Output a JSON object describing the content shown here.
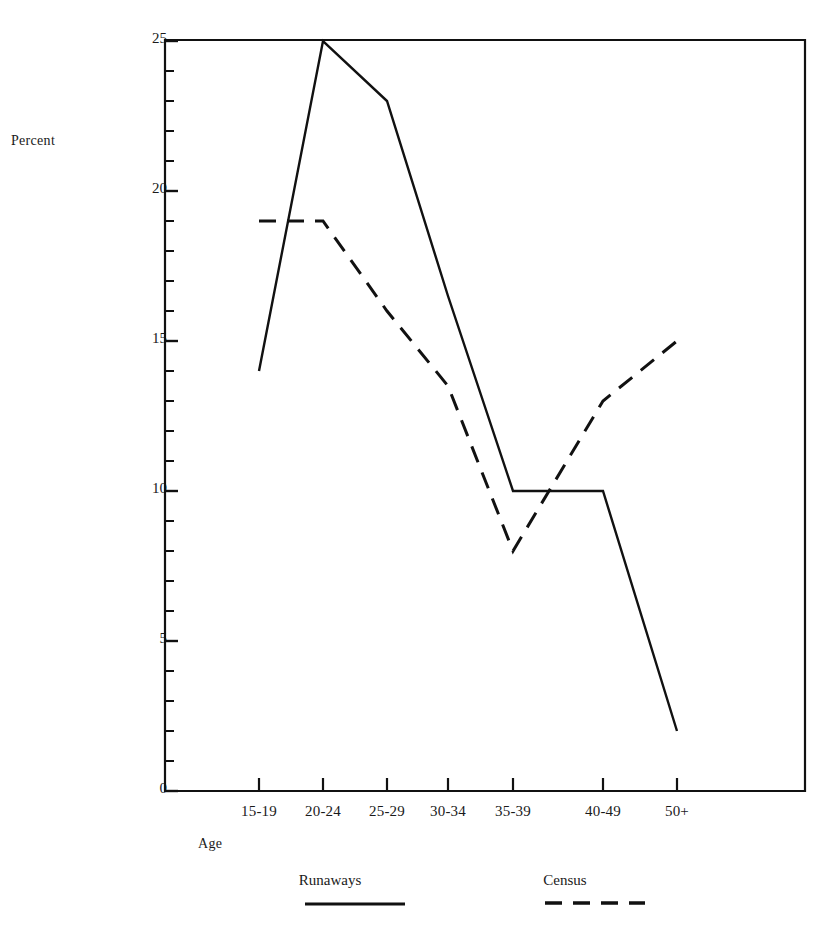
{
  "axes": {
    "ylabel": "Percent",
    "xlabel": "Age"
  },
  "legend": {
    "items": [
      {
        "label": "Runaways",
        "style": "solid",
        "color": "#111111"
      },
      {
        "label": "Census",
        "style": "dashed",
        "color": "#111111"
      }
    ]
  },
  "chart_data": {
    "type": "line",
    "title": "",
    "subtitle": "",
    "xlabel": "Age",
    "ylabel": "Percent",
    "categories": [
      "15-19",
      "20-24",
      "25-29",
      "30-34",
      "35-39",
      "40-49",
      "50+"
    ],
    "ylim": [
      0,
      25
    ],
    "ytick_labels": [
      "0",
      "5",
      "10",
      "15",
      "20",
      "25"
    ],
    "ytick_values": [
      0,
      5,
      10,
      15,
      20,
      25
    ],
    "yminor_step": 1,
    "grid": false,
    "legend_position": "below",
    "series": [
      {
        "name": "Runaways",
        "style": "solid",
        "color": "#111111",
        "values": [
          14,
          25,
          23,
          16.5,
          10,
          10,
          2
        ]
      },
      {
        "name": "Census",
        "style": "dashed",
        "color": "#111111",
        "values": [
          19,
          19,
          16,
          13.5,
          8,
          13,
          15
        ]
      }
    ]
  },
  "geometry": {
    "plot_left": 165,
    "plot_right": 805,
    "plot_top": 37,
    "plot_bottom": 792,
    "y_zero_px": 791,
    "y_unit_px": 30,
    "x_tick_px": [
      259,
      323,
      387,
      448,
      513,
      603,
      677
    ]
  }
}
